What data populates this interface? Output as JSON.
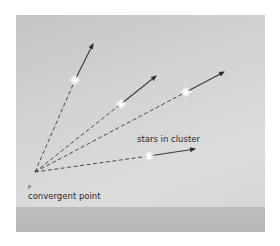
{
  "diagram": {
    "labels": {
      "cluster": "stars in cluster",
      "point_symbol": "P",
      "convergent": "convergent point"
    },
    "colors": {
      "background": "#d0d0d0",
      "band": "#bababa",
      "line": "#3a3a3a",
      "star": "#ffffff"
    },
    "convergent_point": {
      "x": 35,
      "y": 172
    },
    "stars": [
      {
        "x": 75,
        "y": 80,
        "tip_x": 93,
        "tip_y": 44
      },
      {
        "x": 121,
        "y": 104,
        "tip_x": 156,
        "tip_y": 76
      },
      {
        "x": 186,
        "y": 92,
        "tip_x": 224,
        "tip_y": 72
      },
      {
        "x": 149,
        "y": 156,
        "tip_x": 195,
        "tip_y": 149
      }
    ]
  }
}
